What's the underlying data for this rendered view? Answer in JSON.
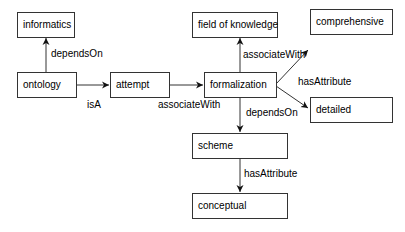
{
  "diagram": {
    "nodes": [
      {
        "id": "informatics",
        "label": "informatics"
      },
      {
        "id": "ontology",
        "label": "ontology"
      },
      {
        "id": "attempt",
        "label": "attempt"
      },
      {
        "id": "formalization",
        "label": "formalization"
      },
      {
        "id": "field_of_knowledge",
        "label": "field of knowledge"
      },
      {
        "id": "comprehensive",
        "label": "comprehensive"
      },
      {
        "id": "detailed",
        "label": "detailed"
      },
      {
        "id": "scheme",
        "label": "scheme"
      },
      {
        "id": "conceptual",
        "label": "conceptual"
      }
    ],
    "edges": [
      {
        "from": "ontology",
        "to": "informatics",
        "label": "dependsOn"
      },
      {
        "from": "ontology",
        "to": "attempt",
        "label": "isA"
      },
      {
        "from": "attempt",
        "to": "formalization",
        "label": "associateWith"
      },
      {
        "from": "formalization",
        "to": "field_of_knowledge",
        "label": "associateWith"
      },
      {
        "from": "formalization",
        "to": "comprehensive",
        "label": "hasAttribute"
      },
      {
        "from": "formalization",
        "to": "detailed",
        "label": ""
      },
      {
        "from": "formalization",
        "to": "scheme",
        "label": "dependsOn"
      },
      {
        "from": "scheme",
        "to": "conceptual",
        "label": "hasAttribute"
      }
    ]
  }
}
